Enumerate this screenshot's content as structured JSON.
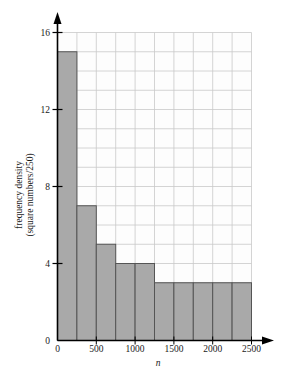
{
  "chart_data": {
    "type": "bar",
    "title": "",
    "subtitle": "",
    "xlabel": "n",
    "ylabel_line1": "frequency density",
    "ylabel_line2": "(square numbers/250)",
    "bin_width": 250,
    "bin_edges": [
      0,
      250,
      500,
      750,
      1000,
      1250,
      1500,
      1750,
      2000,
      2250,
      2500
    ],
    "categories": [
      "0-250",
      "250-500",
      "500-750",
      "750-1000",
      "1000-1250",
      "1250-1500",
      "1500-1750",
      "1750-2000",
      "2000-2250",
      "2250-2500"
    ],
    "values": [
      15,
      7,
      5,
      4,
      4,
      3,
      3,
      3,
      3,
      3
    ],
    "xlim": [
      0,
      2500
    ],
    "ylim": [
      0,
      16
    ],
    "xticks": [
      0,
      500,
      1000,
      1500,
      2000,
      2500
    ],
    "xtick_labels": [
      "0",
      "500",
      "1000",
      "1500",
      "2000",
      "2500"
    ],
    "yticks": [
      0,
      4,
      8,
      12,
      16
    ],
    "ytick_labels": [
      "0",
      "4",
      "8",
      "12",
      "16"
    ],
    "grid": true,
    "grid_x_step": 250,
    "grid_y_step": 1,
    "legend": "none",
    "bar_fill_color": "#a9a9a9",
    "bar_edge_color": "#555555",
    "grid_color": "#c9c9c9",
    "axis_color": "#000000",
    "plot_background": "#fdfdfd"
  }
}
